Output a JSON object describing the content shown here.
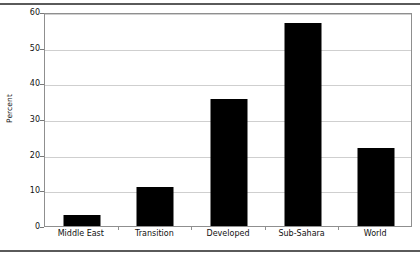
{
  "chart_data": {
    "type": "bar",
    "title": "",
    "subtitle": "",
    "xlabel": "",
    "ylabel": "Percent",
    "categories": [
      "Middle East",
      "Transition",
      "Developed",
      "Sub-Sahara",
      "World"
    ],
    "values": [
      3,
      11,
      35.5,
      57,
      22
    ],
    "series": [
      {
        "name": "Percent",
        "values": [
          3,
          11,
          35.5,
          57,
          22
        ],
        "color": "#000000"
      }
    ],
    "ylim": [
      0,
      60
    ],
    "yticks": [
      0,
      10,
      20,
      30,
      40,
      50,
      60
    ],
    "ytick_labels": [
      "0",
      "10",
      "20",
      "30",
      "40",
      "50",
      "60"
    ],
    "grid": "horizontal",
    "legend": "none",
    "bar_color": "#000000",
    "gridline_color": "#cfcfcf",
    "frame_color": "#8f8f8f",
    "background_color": "#ffffff",
    "annotations": []
  },
  "figure": {
    "ylabel": "Percent",
    "top_rule": "",
    "bottom_rule": ""
  }
}
